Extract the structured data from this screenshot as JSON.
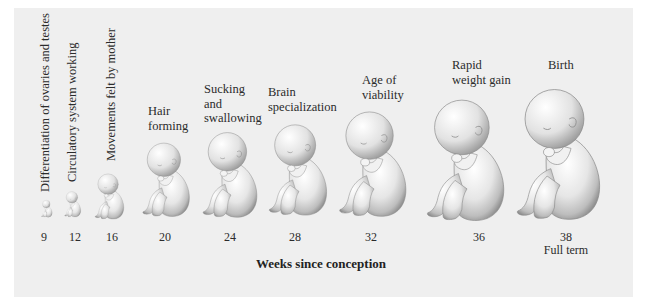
{
  "figure": {
    "axis_title": "Weeks since conception",
    "background_color": "#efefef",
    "stages": [
      {
        "week": "9",
        "milestone": "Differentiation of ovaries and testes",
        "label_orientation": "vertical"
      },
      {
        "week": "12",
        "milestone": "Circulatory system working",
        "label_orientation": "vertical"
      },
      {
        "week": "16",
        "milestone": "Movements felt by mother",
        "label_orientation": "vertical"
      },
      {
        "week": "20",
        "milestone": "Hair\nforming",
        "label_orientation": "horizontal"
      },
      {
        "week": "24",
        "milestone": "Sucking\nand\nswallowing",
        "label_orientation": "horizontal"
      },
      {
        "week": "28",
        "milestone": "Brain\nspecialization",
        "label_orientation": "horizontal"
      },
      {
        "week": "32",
        "milestone": "Age of\nviability",
        "label_orientation": "horizontal"
      },
      {
        "week": "36",
        "milestone": "Rapid\nweight gain",
        "label_orientation": "horizontal"
      },
      {
        "week": "38\nFull term",
        "milestone": "Birth",
        "label_orientation": "horizontal"
      }
    ]
  }
}
